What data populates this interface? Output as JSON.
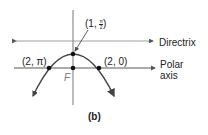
{
  "figure": {
    "caption": "(b)",
    "labels": {
      "vertex": {
        "prefix": "(1, ",
        "num": "π",
        "den": "2",
        "suffix": ")"
      },
      "left_point": "(2, π)",
      "right_point": "(2, 0)",
      "focus": "F",
      "directrix": "Directrix",
      "polar_axis_line1": "Polar",
      "polar_axis_line2": "axis"
    },
    "colors": {
      "line": "#555555",
      "curve": "#444444",
      "text": "#222222"
    }
  }
}
